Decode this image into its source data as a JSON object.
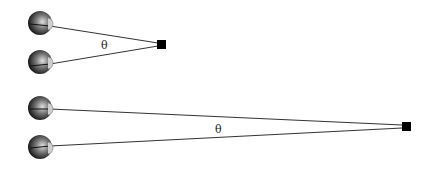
{
  "diagram": {
    "near": {
      "angle_label": "θ",
      "eyes": [
        {
          "cx": 40,
          "cy": 23
        },
        {
          "cx": 40,
          "cy": 62
        }
      ],
      "target": {
        "x": 162,
        "y": 44
      }
    },
    "far": {
      "angle_label": "θ",
      "eyes": [
        {
          "cx": 40,
          "cy": 108
        },
        {
          "cx": 40,
          "cy": 147
        }
      ],
      "target": {
        "x": 406,
        "y": 126
      }
    },
    "colors": {
      "line": "#333333",
      "target": "#000000",
      "eye_dark": "#1a1a1a",
      "eye_light": "#d8d8d8"
    }
  }
}
